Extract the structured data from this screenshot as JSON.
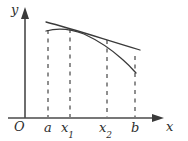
{
  "figure": {
    "kind": "cartesian-plot",
    "background_color": "#ffffff",
    "ink_color": "#3a3a3a",
    "dash_color": "#6b6b6b",
    "axes": {
      "y_axis_label": "y",
      "x_axis_label": "x",
      "origin_label": "O",
      "origin_px": {
        "x": 25,
        "y": 118
      },
      "y_axis_top_px": 10,
      "x_axis_right_px": 163
    },
    "tick_labels": [
      {
        "name": "a",
        "text": "a",
        "sub": "",
        "x_px": 48
      },
      {
        "name": "x1",
        "text": "x",
        "sub": "1",
        "x_px": 70
      },
      {
        "name": "x2",
        "text": "x",
        "sub": "2",
        "x_px": 107
      },
      {
        "name": "b",
        "text": "b",
        "sub": "",
        "x_px": 135
      }
    ],
    "dashed_ordinates": [
      {
        "name": "dashed-line-a",
        "x_px": 48,
        "y_top_px": 30,
        "y_bottom_px": 117
      },
      {
        "name": "dashed-line-x1",
        "x_px": 70,
        "y_top_px": 29,
        "y_bottom_px": 117
      },
      {
        "name": "dashed-line-x2",
        "x_px": 107,
        "y_top_px": 40,
        "y_bottom_px": 117
      },
      {
        "name": "dashed-line-b",
        "x_px": 135,
        "y_top_px": 56,
        "y_bottom_px": 117
      }
    ],
    "curves": [
      {
        "name": "function-curve",
        "description": "concave decreasing curve",
        "path": "M 46 31 C 58 27.5, 70 28.5, 84 34 C 98 40.5, 112 50, 122 59 C 129 65, 133 69.5, 136 73"
      },
      {
        "name": "secant-line",
        "description": "nearly straight slightly declining chord",
        "path": "M 46 22 C 70 28, 100 38, 140 50"
      }
    ]
  }
}
